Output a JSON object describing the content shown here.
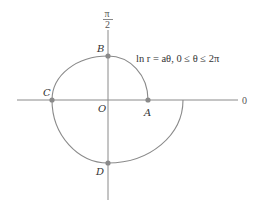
{
  "diagram": {
    "type": "polar-plot",
    "equation": "ln r = aθ, 0 ≤ θ ≤ 2π",
    "axis_labels": {
      "polar_axis": "0",
      "vertical_top_num": "π",
      "vertical_top_den": "2"
    },
    "points": {
      "origin": "O",
      "A": "A",
      "B": "B",
      "C": "C",
      "D": "D"
    },
    "colors": {
      "curve": "#8a8a8a",
      "axis": "#8a8a8a",
      "point": "#8a8a8a",
      "text": "#333333"
    }
  }
}
